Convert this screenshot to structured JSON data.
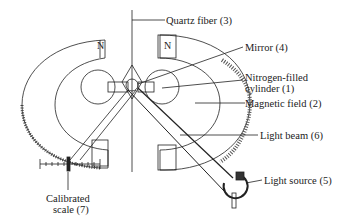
{
  "diagram": {
    "labels": {
      "quartz_fiber": "Quartz fiber (3)",
      "mirror": "Mirror (4)",
      "nitrogen_cylinder_line1": "Nitrogen-filled",
      "nitrogen_cylinder_line2": "cylinder (1)",
      "magnetic_field": "Magnetic field (2)",
      "light_beam": "Light beam (6)",
      "light_source": "Light source (5)",
      "scale_line1": "Calibrated",
      "scale_line2": "scale (7)"
    },
    "poles": {
      "left_top": "N",
      "right_top": "N",
      "left_bottom": "S",
      "right_bottom": "S"
    },
    "colors": {
      "ink": "#222222",
      "background": "#ffffff"
    }
  }
}
